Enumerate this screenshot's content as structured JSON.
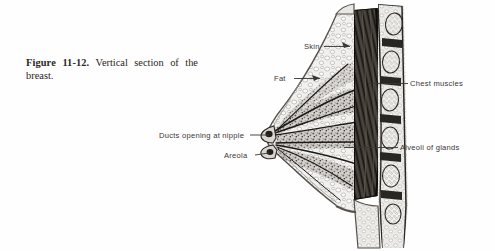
{
  "figure": {
    "number_label": "Figure 11-12.",
    "caption_text": "Vertical section of the breast.",
    "background_color": "#fefefe",
    "ink_color": "#2a2724",
    "label_color": "#3a3734"
  },
  "labels": {
    "skin": "Skin",
    "fat": "Fat",
    "chest_muscles": "Chest muscles",
    "alveoli": "Alveoli of glands",
    "ducts": "Ducts opening at nipple",
    "areola": "Areola"
  },
  "illustration": {
    "title": "Vertical section of the breast",
    "style": "grayscale halftone engraving",
    "structures": [
      "skin",
      "subcutaneous fat lobules",
      "lactiferous ducts radiating to nipple",
      "areola",
      "alveoli of mammary glands",
      "pectoral chest muscles",
      "rib cross-sections",
      "chest wall"
    ]
  }
}
